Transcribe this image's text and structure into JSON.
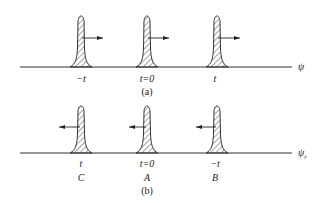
{
  "diagram": {
    "panel_a": {
      "caption": "(a)",
      "axis_label": "ψ",
      "direction": "right",
      "pulses": [
        {
          "label": "−t",
          "x": 81
        },
        {
          "label": "t=0",
          "x": 147
        },
        {
          "label": "t",
          "x": 218
        }
      ]
    },
    "panel_b": {
      "caption": "(b)",
      "axis_label": "ψ",
      "axis_subscript": "r",
      "direction": "left",
      "pulses": [
        {
          "label": "t",
          "point": "C",
          "x": 81
        },
        {
          "label": "t=0",
          "point": "A",
          "x": 147
        },
        {
          "label": "−t",
          "point": "B",
          "x": 218
        }
      ]
    },
    "colors": {
      "line": "#333333",
      "hatch": "#333333",
      "background": "#ffffff"
    }
  }
}
